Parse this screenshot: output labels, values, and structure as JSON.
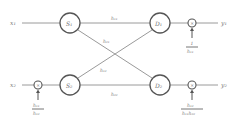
{
  "inputs": {
    "x1": "x₁",
    "x2": "x₂"
  },
  "outputs": {
    "y1": "y₁",
    "y2": "y₂"
  },
  "nodes": {
    "S1": "S₁",
    "S2": "S₂",
    "D1": "D₁",
    "D2": "D₂"
  },
  "edges": {
    "top": "h₁₁",
    "upper_diag": "h₂₁",
    "lower_diag": "h₁₂",
    "bottom": "h₂₂"
  },
  "multipliers": {
    "symbol": "×",
    "left": {
      "num": "h₁₁",
      "den": "h₁₂"
    },
    "top_right": {
      "num": "1",
      "den": "h₁₁"
    },
    "bottom_right": {
      "num": "h₁₂",
      "den": "h₁₁h₂₂"
    }
  }
}
